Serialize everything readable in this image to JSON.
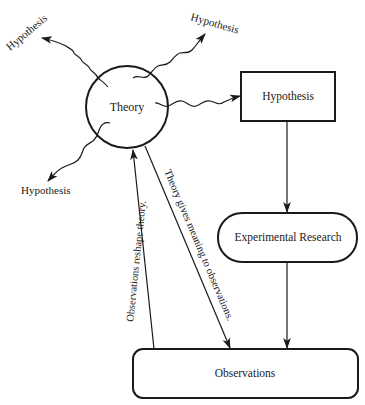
{
  "diagram": {
    "colors": {
      "stroke": "#1a1a1a",
      "background": "#ffffff"
    },
    "nodes": {
      "theory": {
        "label": "Theory",
        "shape": "circle"
      },
      "hypothesis_box": {
        "label": "Hypothesis",
        "shape": "rectangle"
      },
      "experimental_research": {
        "label": "Experimental Research",
        "shape": "rounded-pill"
      },
      "observations": {
        "label": "Observations",
        "shape": "rounded-rectangle"
      }
    },
    "radiating_hypotheses": [
      {
        "label": "Hypothesis",
        "position": "top-left"
      },
      {
        "label": "Hypothesis",
        "position": "top-right"
      },
      {
        "label": "Hypothesis",
        "position": "bottom-left"
      }
    ],
    "edges": [
      {
        "from": "theory",
        "to": "hypothesis (top-left)",
        "style": "wavy-arrow"
      },
      {
        "from": "theory",
        "to": "hypothesis (top-right)",
        "style": "wavy-arrow"
      },
      {
        "from": "theory",
        "to": "hypothesis (bottom-left)",
        "style": "wavy-arrow"
      },
      {
        "from": "theory",
        "to": "hypothesis_box",
        "style": "wavy-arrow"
      },
      {
        "from": "hypothesis_box",
        "to": "experimental_research",
        "style": "arrow"
      },
      {
        "from": "experimental_research",
        "to": "observations",
        "style": "arrow"
      },
      {
        "from": "theory",
        "to": "observations",
        "style": "arrow",
        "label": "Theory gives meaning to observations."
      },
      {
        "from": "observations",
        "to": "theory",
        "style": "arrow",
        "label": "Observations reshape theory."
      }
    ]
  }
}
